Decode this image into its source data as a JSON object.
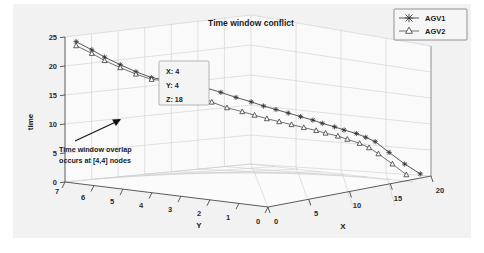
{
  "figure": {
    "title": "Time window conflict",
    "background_color": "#f2f2f2"
  },
  "legend": {
    "entries": [
      {
        "label": "AGV1",
        "marker": "asterisk-marker",
        "color": "#3c3c3c"
      },
      {
        "label": "AGV2",
        "marker": "triangle-marker",
        "color": "#5a5a5a"
      }
    ]
  },
  "datatip": {
    "lines": [
      "X: 4",
      "Y: 4",
      "Z: 18"
    ],
    "x_label": "X: 4",
    "y_label": "Y: 4",
    "z_label": "Z: 18"
  },
  "annotation": {
    "line1": "Time window overlap",
    "line2": "occurs at [4,4] nodes"
  },
  "axes": {
    "x": {
      "label": "X",
      "ticks": [
        "0",
        "5",
        "10",
        "15",
        "20"
      ],
      "min": 0,
      "max": 20
    },
    "y": {
      "label": "Y",
      "ticks": [
        "7",
        "6",
        "5",
        "4",
        "3",
        "2",
        "1",
        "0"
      ],
      "min": 0,
      "max": 7
    },
    "z": {
      "label": "time",
      "ticks": [
        "0",
        "5",
        "10",
        "15",
        "20",
        "25"
      ],
      "min": 0,
      "max": 25
    }
  },
  "chart_data": {
    "type": "line",
    "title": "Time window conflict",
    "xlabel": "X",
    "ylabel": "Y",
    "zlabel": "time",
    "xlim": [
      0,
      20
    ],
    "ylim": [
      0,
      7
    ],
    "zlim": [
      0,
      25
    ],
    "grid": true,
    "legend_position": "top-right",
    "projection": "3d",
    "annotations": [
      {
        "text": "Time window overlap occurs at [4,4] nodes",
        "points_to": [
          4,
          4,
          18
        ]
      },
      {
        "text": "X: 4 Y: 4 Z: 18",
        "type": "datatip",
        "point": [
          4,
          4,
          18
        ]
      }
    ],
    "series": [
      {
        "name": "AGV1",
        "marker": "asterisk",
        "points": [
          [
            0.3,
            6.7,
            24.3
          ],
          [
            0.8,
            6.3,
            23.0
          ],
          [
            1.3,
            6.0,
            21.8
          ],
          [
            1.8,
            5.6,
            20.6
          ],
          [
            2.3,
            5.2,
            19.5
          ],
          [
            2.8,
            4.8,
            18.6
          ],
          [
            3.4,
            4.4,
            18.2
          ],
          [
            4.0,
            4.0,
            18.0
          ],
          [
            4.8,
            3.6,
            17.2
          ],
          [
            5.6,
            3.2,
            16.3
          ],
          [
            6.4,
            2.9,
            15.4
          ],
          [
            7.2,
            2.6,
            14.6
          ],
          [
            8.0,
            2.4,
            13.8
          ],
          [
            8.8,
            2.2,
            13.1
          ],
          [
            9.6,
            2.0,
            12.4
          ],
          [
            10.4,
            1.8,
            11.7
          ],
          [
            11.2,
            1.6,
            11.0
          ],
          [
            12.0,
            1.5,
            10.3
          ],
          [
            12.8,
            1.3,
            9.6
          ],
          [
            13.6,
            1.2,
            8.9
          ],
          [
            14.4,
            1.0,
            8.2
          ],
          [
            15.2,
            0.9,
            7.4
          ],
          [
            16.0,
            0.8,
            6.5
          ],
          [
            17.0,
            0.6,
            4.5
          ],
          [
            18.2,
            0.4,
            2.3
          ],
          [
            19.4,
            0.2,
            0.4
          ]
        ]
      },
      {
        "name": "AGV2",
        "marker": "triangle",
        "points": [
          [
            0.3,
            6.7,
            23.6
          ],
          [
            0.8,
            6.3,
            22.4
          ],
          [
            1.3,
            6.0,
            21.2
          ],
          [
            1.8,
            5.6,
            20.1
          ],
          [
            2.3,
            5.2,
            19.1
          ],
          [
            2.8,
            4.8,
            18.3
          ],
          [
            3.4,
            4.4,
            18.1
          ],
          [
            4.0,
            4.0,
            18.0
          ],
          [
            4.6,
            3.7,
            16.2
          ],
          [
            5.2,
            3.4,
            14.6
          ],
          [
            6.0,
            3.1,
            13.6
          ],
          [
            6.8,
            2.8,
            12.9
          ],
          [
            7.6,
            2.6,
            12.2
          ],
          [
            8.4,
            2.4,
            11.5
          ],
          [
            9.2,
            2.2,
            10.9
          ],
          [
            10.0,
            2.0,
            10.3
          ],
          [
            10.8,
            1.8,
            9.7
          ],
          [
            11.6,
            1.6,
            9.1
          ],
          [
            12.4,
            1.5,
            8.5
          ],
          [
            13.2,
            1.3,
            7.9
          ],
          [
            14.0,
            1.2,
            7.2
          ],
          [
            14.8,
            1.0,
            6.4
          ],
          [
            15.6,
            0.9,
            5.5
          ],
          [
            16.4,
            0.8,
            4.3
          ],
          [
            17.4,
            0.6,
            2.4
          ],
          [
            18.4,
            0.4,
            0.4
          ]
        ]
      }
    ]
  }
}
